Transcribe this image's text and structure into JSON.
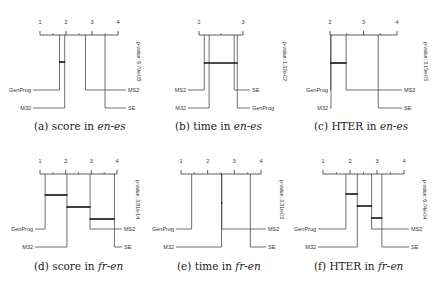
{
  "figure": {
    "panels": [
      {
        "id": "a",
        "caption_prefix": "(a) score in ",
        "caption_lang": "en-es",
        "pvalue": "p-value: 6.79e-08"
      },
      {
        "id": "b",
        "caption_prefix": "(b) time in ",
        "caption_lang": "en-es",
        "pvalue": "p-value: 1.32e-02"
      },
      {
        "id": "c",
        "caption_prefix": "(c) HTER in ",
        "caption_lang": "en-es",
        "pvalue": "p-value: 3.15e-05"
      },
      {
        "id": "d",
        "caption_prefix": "(d) score in ",
        "caption_lang": "fr-en",
        "pvalue": "p-value: 3.81e-14"
      },
      {
        "id": "e",
        "caption_prefix": "(e) time in ",
        "caption_lang": "fr-en",
        "pvalue": "p-value: 3.31e-03"
      },
      {
        "id": "f",
        "caption_prefix": "(f) HTER in ",
        "caption_lang": "fr-en",
        "pvalue": "p-value: 6.74e-04"
      }
    ]
  },
  "chart_data": [
    {
      "type": "critical-difference-diagram",
      "title": "(a) score in en-es",
      "xlabel": "average rank",
      "axis": {
        "min": 1,
        "max": 4,
        "ticks": [
          1,
          2,
          3,
          4
        ]
      },
      "pvalue": "6.79e-08",
      "methods": [
        {
          "name": "GenProg",
          "rank": 1.75,
          "side": "left",
          "row": 0
        },
        {
          "name": "M32",
          "rank": 1.95,
          "side": "left",
          "row": 1
        },
        {
          "name": "MS2",
          "rank": 2.75,
          "side": "right",
          "row": 0
        },
        {
          "name": "SE",
          "rank": 3.5,
          "side": "right",
          "row": 1
        }
      ],
      "cliques": [
        {
          "from": 1.75,
          "to": 1.95
        }
      ]
    },
    {
      "type": "critical-difference-diagram",
      "title": "(b) time in en-es",
      "xlabel": "average rank",
      "axis": {
        "min": 2,
        "max": 3,
        "ticks": [
          2,
          3
        ]
      },
      "pvalue": "1.32e-02",
      "methods": [
        {
          "name": "MS2",
          "rank": 2.12,
          "side": "left",
          "row": 0
        },
        {
          "name": "M32",
          "rank": 2.23,
          "side": "left",
          "row": 1
        },
        {
          "name": "SE",
          "rank": 2.8,
          "side": "right",
          "row": 0
        },
        {
          "name": "GenProg",
          "rank": 2.87,
          "side": "right",
          "row": 1
        }
      ],
      "cliques": [
        {
          "from": 2.12,
          "to": 2.87
        }
      ]
    },
    {
      "type": "critical-difference-diagram",
      "title": "(c) HTER in en-es",
      "xlabel": "average rank",
      "axis": {
        "min": 2,
        "max": 4,
        "ticks": [
          2,
          3,
          4
        ]
      },
      "pvalue": "3.15e-05",
      "methods": [
        {
          "name": "GenProg",
          "rank": 2.02,
          "side": "left",
          "row": 0
        },
        {
          "name": "M32",
          "rank": 2.03,
          "side": "left",
          "row": 1
        },
        {
          "name": "MS2",
          "rank": 2.48,
          "side": "right",
          "row": 0
        },
        {
          "name": "SE",
          "rank": 3.44,
          "side": "right",
          "row": 1
        }
      ],
      "cliques": [
        {
          "from": 2.02,
          "to": 2.48
        }
      ]
    },
    {
      "type": "critical-difference-diagram",
      "title": "(d) score in fr-en",
      "xlabel": "average rank",
      "axis": {
        "min": 1,
        "max": 4,
        "ticks": [
          1,
          2,
          3,
          4
        ]
      },
      "pvalue": "3.81e-14",
      "methods": [
        {
          "name": "GenProg",
          "rank": 1.2,
          "side": "left",
          "row": 0
        },
        {
          "name": "M32",
          "rank": 2.05,
          "side": "left",
          "row": 1
        },
        {
          "name": "MS2",
          "rank": 2.95,
          "side": "right",
          "row": 0
        },
        {
          "name": "SE",
          "rank": 3.9,
          "side": "right",
          "row": 1
        }
      ],
      "cliques": [
        {
          "from": 1.2,
          "to": 2.05
        },
        {
          "from": 2.05,
          "to": 2.95
        },
        {
          "from": 2.95,
          "to": 3.9
        }
      ]
    },
    {
      "type": "critical-difference-diagram",
      "title": "(e) time in fr-en",
      "xlabel": "average rank",
      "axis": {
        "min": 1,
        "max": 4,
        "ticks": [
          1,
          2,
          3,
          4
        ]
      },
      "pvalue": "3.31e-03",
      "methods": [
        {
          "name": "GenProg",
          "rank": 1.4,
          "side": "left",
          "row": 0
        },
        {
          "name": "M32",
          "rank": 2.52,
          "side": "left",
          "row": 1
        },
        {
          "name": "MS2",
          "rank": 2.53,
          "side": "right",
          "row": 0
        },
        {
          "name": "SE",
          "rank": 3.6,
          "side": "right",
          "row": 1
        }
      ],
      "cliques": [
        {
          "from": 2.52,
          "to": 2.53
        }
      ]
    },
    {
      "type": "critical-difference-diagram",
      "title": "(f) HTER in fr-en",
      "xlabel": "average rank",
      "axis": {
        "min": 1,
        "max": 4,
        "ticks": [
          1,
          2,
          3,
          4
        ]
      },
      "pvalue": "6.74e-04",
      "methods": [
        {
          "name": "GenProg",
          "rank": 1.85,
          "side": "left",
          "row": 0
        },
        {
          "name": "M32",
          "rank": 2.27,
          "side": "left",
          "row": 1
        },
        {
          "name": "MS2",
          "rank": 2.8,
          "side": "right",
          "row": 0
        },
        {
          "name": "SE",
          "rank": 3.18,
          "side": "right",
          "row": 1
        }
      ],
      "cliques": [
        {
          "from": 1.85,
          "to": 2.27
        },
        {
          "from": 2.27,
          "to": 2.8
        },
        {
          "from": 2.8,
          "to": 3.18
        }
      ]
    }
  ],
  "layout": {
    "panels": [
      {
        "axis_x0": 40,
        "axis_x1": 118,
        "axis_y": 35,
        "row0_y": 90,
        "row1_y": 108,
        "left_label_x": 33,
        "right_label_x": 126,
        "clique_y0": 62,
        "pv_x": 137,
        "pv_y": 42,
        "cap_x": 34,
        "cap_y": 122
      },
      {
        "axis_x0": 199,
        "axis_x1": 243,
        "axis_y": 35,
        "row0_y": 90,
        "row1_y": 108,
        "left_label_x": 188,
        "right_label_x": 250,
        "clique_y0": 63,
        "pv_x": 283,
        "pv_y": 42,
        "cap_x": 175,
        "cap_y": 122
      },
      {
        "axis_x0": 330,
        "axis_x1": 397,
        "axis_y": 35,
        "row0_y": 90,
        "row1_y": 108,
        "left_label_x": 330,
        "right_label_x": 402,
        "clique_y0": 63,
        "pv_x": 424,
        "pv_y": 42,
        "cap_x": 314,
        "cap_y": 122
      },
      {
        "axis_x0": 40,
        "axis_x1": 117,
        "axis_y": 174,
        "row0_y": 229,
        "row1_y": 247,
        "left_label_x": 35,
        "right_label_x": 122,
        "clique_y0": 195,
        "clique_dy": 12,
        "pv_x": 136,
        "pv_y": 180,
        "cap_x": 34,
        "cap_y": 262
      },
      {
        "axis_x0": 181,
        "axis_x1": 261,
        "axis_y": 174,
        "row0_y": 229,
        "row1_y": 247,
        "left_label_x": 176,
        "right_label_x": 266,
        "clique_y0": 203,
        "pv_x": 280,
        "pv_y": 180,
        "cap_x": 177,
        "cap_y": 262
      },
      {
        "axis_x0": 323,
        "axis_x1": 404,
        "axis_y": 174,
        "row0_y": 229,
        "row1_y": 247,
        "left_label_x": 318,
        "right_label_x": 409,
        "clique_y0": 194,
        "clique_dy": 12,
        "pv_x": 423,
        "pv_y": 180,
        "cap_x": 314,
        "cap_y": 262
      }
    ]
  }
}
